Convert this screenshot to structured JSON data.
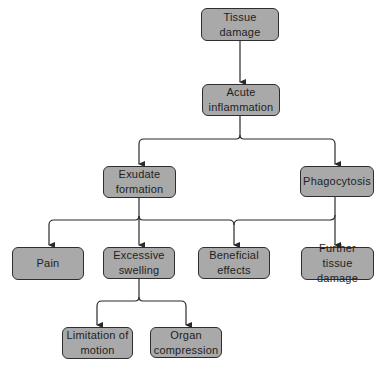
{
  "diagram": {
    "type": "flowchart",
    "colors": {
      "node_fill": "#a9a9a9",
      "node_border": "#2e2e2e",
      "text": "#1e1e1e",
      "edge": "#2a2a2a",
      "background": "#ffffff"
    },
    "nodes": {
      "tissue_damage": {
        "label": "Tissue\ndamage"
      },
      "acute_inflammation": {
        "label": "Acute\ninflammation"
      },
      "exudate_formation": {
        "label": "Exudate\nformation"
      },
      "phagocytosis": {
        "label": "Phagocytosis"
      },
      "pain": {
        "label": "Pain"
      },
      "excessive_swelling": {
        "label": "Excessive\nswelling"
      },
      "beneficial_effects": {
        "label": "Beneficial\neffects"
      },
      "further_tissue_damage": {
        "label": "Further tissue\ndamage"
      },
      "limitation_of_motion": {
        "label": "Limitation of\nmotion"
      },
      "organ_compression": {
        "label": "Organ\ncompression"
      }
    },
    "edges": [
      {
        "from": "Tissue damage",
        "to": "Acute inflammation"
      },
      {
        "from": "Acute inflammation",
        "to": "Exudate formation"
      },
      {
        "from": "Acute inflammation",
        "to": "Phagocytosis"
      },
      {
        "from": "Exudate formation",
        "to": "Pain"
      },
      {
        "from": "Exudate formation",
        "to": "Excessive swelling"
      },
      {
        "from": "Exudate formation",
        "to": "Beneficial effects"
      },
      {
        "from": "Phagocytosis",
        "to": "Beneficial effects"
      },
      {
        "from": "Phagocytosis",
        "to": "Further tissue damage"
      },
      {
        "from": "Excessive swelling",
        "to": "Limitation of motion"
      },
      {
        "from": "Excessive swelling",
        "to": "Organ compression"
      }
    ]
  }
}
